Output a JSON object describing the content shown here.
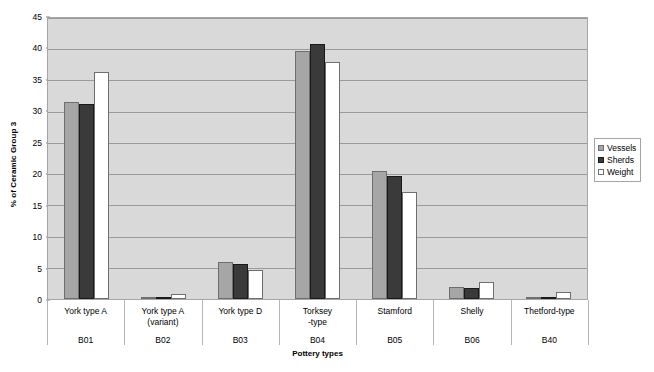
{
  "chart_data": {
    "type": "bar",
    "title": "",
    "xlabel": "Pottery types",
    "ylabel": "% of Ceramic Group 3",
    "ylim": [
      0,
      45
    ],
    "ytick_step": 5,
    "yticks": [
      0,
      5,
      10,
      15,
      20,
      25,
      30,
      35,
      40,
      45
    ],
    "grid": "horizontal",
    "legend_position": "right",
    "categories": [
      "York type A",
      "York type A (variant)",
      "York type D",
      "Torksey -type",
      "Stamford",
      "Shelly",
      "Thetford-type"
    ],
    "category_lines": [
      [
        "York type A",
        ""
      ],
      [
        "York type A",
        "(variant)"
      ],
      [
        "York type D",
        ""
      ],
      [
        "Torksey",
        "-type"
      ],
      [
        "Stamford",
        ""
      ],
      [
        "Shelly",
        ""
      ],
      [
        "Thetford-type",
        ""
      ]
    ],
    "category_codes": [
      "B01",
      "B02",
      "B03",
      "B04",
      "B05",
      "B06",
      "B40"
    ],
    "series": [
      {
        "name": "Vessels",
        "color": "#a6a6a6",
        "values": [
          31.4,
          0.2,
          5.9,
          39.4,
          20.3,
          1.9,
          0.3
        ]
      },
      {
        "name": "Sherds",
        "color": "#3a3a3a",
        "values": [
          31.0,
          0.3,
          5.5,
          40.5,
          19.6,
          1.8,
          0.4
        ]
      },
      {
        "name": "Weight",
        "color": "#ffffff",
        "values": [
          36.1,
          0.8,
          4.6,
          37.7,
          17.0,
          2.7,
          1.1
        ]
      }
    ]
  },
  "legend": {
    "items": [
      {
        "label": "Vessels"
      },
      {
        "label": "Sherds"
      },
      {
        "label": "Weight"
      }
    ]
  },
  "colors": {
    "plot_background": "#d9d9d9",
    "gridline": "#9a9a9a",
    "axis_line": "#a6a6a6",
    "vessels": "#a6a6a6",
    "sherds": "#3a3a3a",
    "weight": "#ffffff",
    "page_background": "#ffffff"
  }
}
